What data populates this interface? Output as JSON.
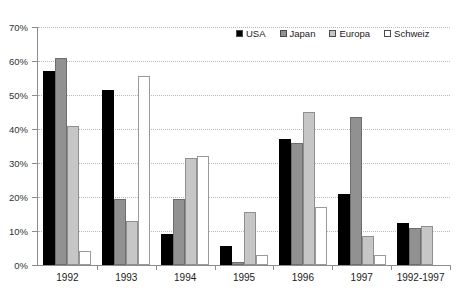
{
  "chart_data": {
    "type": "bar",
    "title": "",
    "xlabel": "",
    "ylabel": "",
    "ylim": [
      0,
      70
    ],
    "ytick_labels": [
      "0%",
      "10%",
      "20%",
      "30%",
      "40%",
      "50%",
      "60%",
      "70%"
    ],
    "ytick_values": [
      0,
      10,
      20,
      30,
      40,
      50,
      60,
      70
    ],
    "grid": true,
    "legend_position": "top-right",
    "categories": [
      "1992",
      "1993",
      "1994",
      "1995",
      "1996",
      "1997",
      "1992-1997"
    ],
    "series": [
      {
        "name": "USA",
        "color": "#000000",
        "values": [
          57,
          51.5,
          9,
          5.5,
          37,
          21,
          12.5
        ]
      },
      {
        "name": "Japan",
        "color": "#919191",
        "values": [
          61,
          19.5,
          19.5,
          1,
          36,
          43.5,
          11
        ]
      },
      {
        "name": "Europa",
        "color": "#c6c6c6",
        "values": [
          41,
          13,
          31.5,
          15.5,
          45,
          8.5,
          11.5
        ]
      },
      {
        "name": "Schweiz",
        "color": "#ffffff",
        "values": [
          4,
          55.5,
          32,
          3,
          17,
          3,
          0
        ]
      }
    ]
  },
  "legend": {
    "items": [
      {
        "label": "USA"
      },
      {
        "label": "Japan"
      },
      {
        "label": "Europa"
      },
      {
        "label": "Schweiz"
      }
    ]
  }
}
